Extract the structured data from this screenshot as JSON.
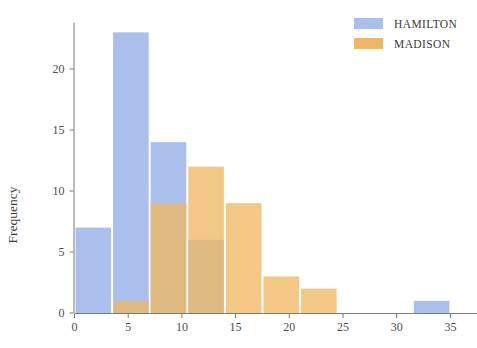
{
  "chart_data": {
    "type": "bar",
    "subtype": "histogram-overlay",
    "title": "",
    "xlabel": "",
    "ylabel": "Frequency",
    "xlim": [
      -1.5,
      37.5
    ],
    "ylim": [
      0,
      23.8
    ],
    "grid": false,
    "legend_position": "top-right",
    "bin_width": 3.5,
    "bin_starts": [
      0,
      3.5,
      7,
      10.5,
      14,
      17.5,
      21,
      24.5,
      28,
      31.5
    ],
    "xticks": [
      0,
      5,
      10,
      15,
      20,
      25,
      30,
      35
    ],
    "xtick_labels": [
      "0",
      "5",
      "10",
      "15",
      "20",
      "25",
      "30",
      "35"
    ],
    "yticks": [
      0,
      5,
      10,
      15,
      20
    ],
    "ytick_labels": [
      "0",
      "5",
      "10",
      "15",
      "20"
    ],
    "series": [
      {
        "name": "HAMILTON",
        "color": "#aabfec",
        "values": [
          7,
          23,
          14,
          6,
          0,
          0,
          0,
          0,
          0,
          1
        ]
      },
      {
        "name": "MADISON",
        "color": "#eeb862",
        "values": [
          0,
          1,
          9,
          12,
          9,
          3,
          2,
          0,
          0,
          0
        ]
      }
    ]
  },
  "legend": {
    "items": [
      {
        "label": "HAMILTON",
        "color": "#aabfec"
      },
      {
        "label": "MADISON",
        "color": "#eeb862"
      }
    ]
  },
  "axes": {
    "y_title": "Frequency"
  }
}
